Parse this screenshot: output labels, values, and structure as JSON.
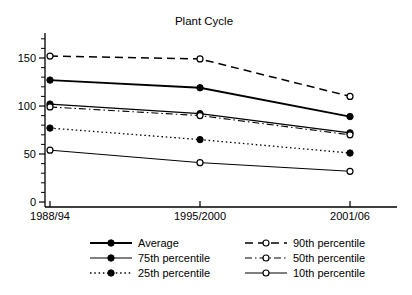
{
  "figure": {
    "background": "#ffffff",
    "ink_color": "#000000"
  },
  "chart_data": {
    "type": "line",
    "title": "Plant Cycle",
    "categories": [
      "1988/94",
      "1995/2000",
      "2001/06"
    ],
    "series": [
      {
        "name": "Average",
        "values": [
          127,
          119,
          89
        ],
        "line": "solid-thick",
        "marker": "filled-circle"
      },
      {
        "name": "75th percentile",
        "values": [
          102,
          92,
          72
        ],
        "line": "solid",
        "marker": "filled-circle"
      },
      {
        "name": "25th percentile",
        "values": [
          77,
          65,
          51
        ],
        "line": "dotted",
        "marker": "filled-circle"
      },
      {
        "name": "90th percentile",
        "values": [
          152,
          149,
          110
        ],
        "line": "dashed",
        "marker": "open-circle"
      },
      {
        "name": "50th percentile",
        "values": [
          99,
          90,
          70
        ],
        "line": "dash-dot",
        "marker": "open-circle"
      },
      {
        "name": "10th percentile",
        "values": [
          54,
          41,
          32
        ],
        "line": "solid-thin",
        "marker": "open-circle"
      }
    ],
    "xlabel": "",
    "ylabel": "",
    "ylim": [
      0,
      170
    ],
    "yticks_major": [
      0,
      50,
      100,
      150
    ],
    "ytick_minor_step": 10,
    "grid": false,
    "legend_position": "bottom",
    "legend_columns": [
      [
        "Average",
        "75th percentile",
        "25th percentile"
      ],
      [
        "90th percentile",
        "50th percentile",
        "10th percentile"
      ]
    ]
  }
}
